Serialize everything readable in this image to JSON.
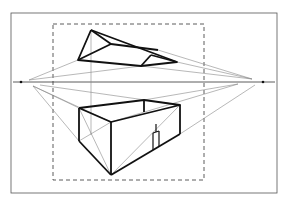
{
  "diagram": {
    "title": "",
    "type": "two-point perspective construction",
    "background": "#ffffff",
    "ink": "#111111",
    "guide_color": "#777777",
    "frame": {
      "x": 11,
      "y": 13,
      "w": 266,
      "h": 180
    },
    "picture_plane": {
      "x": 53,
      "y": 24,
      "w": 151,
      "h": 156,
      "style": "dashed"
    },
    "horizon": {
      "y": 82,
      "x1": 13,
      "x2": 275
    },
    "vanishing_points": [
      {
        "name": "left-vp",
        "x": 21,
        "y": 82
      },
      {
        "name": "right-vp",
        "x": 263,
        "y": 82
      }
    ],
    "objects": {
      "upper_shape": "floating wedge above horizon",
      "lower_shape": "open box with door below horizon"
    }
  }
}
